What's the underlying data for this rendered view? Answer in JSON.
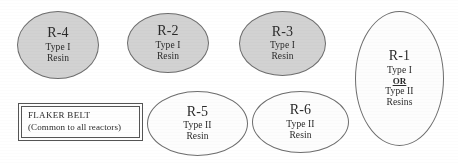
{
  "diagram": {
    "background_color": "#ffffff",
    "filled_color": "#d2d2d2",
    "hollow_color": "#fdfdfd",
    "outline_color": "#6d6d6d",
    "nodes": [
      {
        "id": "R-4",
        "title": "R-4",
        "line1": "Type I",
        "line2": "Resin",
        "line3": "",
        "line4": ""
      },
      {
        "id": "R-2",
        "title": "R-2",
        "line1": "Type I",
        "line2": "Resin",
        "line3": "",
        "line4": ""
      },
      {
        "id": "R-3",
        "title": "R-3",
        "line1": "Type I",
        "line2": "Resin",
        "line3": "",
        "line4": ""
      },
      {
        "id": "R-1",
        "title": "R-1",
        "line1": "Type I",
        "line2": "OR",
        "line3": "Type II",
        "line4": "Resins"
      },
      {
        "id": "R-5",
        "title": "R-5",
        "line1": "Type II",
        "line2": "Resin",
        "line3": "",
        "line4": ""
      },
      {
        "id": "R-6",
        "title": "R-6",
        "line1": "Type II",
        "line2": "Resin",
        "line3": "",
        "line4": ""
      }
    ],
    "flaker_belt": {
      "line1": "FLAKER BELT",
      "line2": "(Common to all reactors)"
    }
  }
}
